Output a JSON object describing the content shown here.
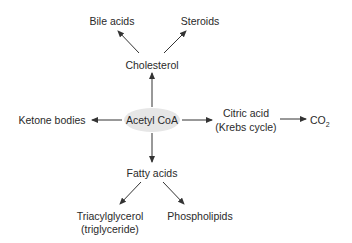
{
  "diagram": {
    "center": {
      "label": "Acetyl CoA",
      "fill": "#e6e6e6"
    },
    "nodes": {
      "cholesterol": "Cholesterol",
      "bile_acids": "Bile acids",
      "steroids": "Steroids",
      "ketone_bodies": "Ketone bodies",
      "citric_acid_line1": "Citric acid",
      "citric_acid_line2": "(Krebs cycle)",
      "co2_main": "CO",
      "co2_sub": "2",
      "fatty_acids": "Fatty acids",
      "triacylglycerol_line1": "Triacylglycerol",
      "triacylglycerol_line2": "(triglyceride)",
      "phospholipids": "Phospholipids"
    },
    "edges": [
      {
        "from": "Acetyl CoA",
        "to": "Cholesterol"
      },
      {
        "from": "Cholesterol",
        "to": "Bile acids"
      },
      {
        "from": "Cholesterol",
        "to": "Steroids"
      },
      {
        "from": "Acetyl CoA",
        "to": "Ketone bodies"
      },
      {
        "from": "Acetyl CoA",
        "to": "Citric acid (Krebs cycle)"
      },
      {
        "from": "Citric acid (Krebs cycle)",
        "to": "CO2"
      },
      {
        "from": "Acetyl CoA",
        "to": "Fatty acids"
      },
      {
        "from": "Fatty acids",
        "to": "Triacylglycerol (triglyceride)"
      },
      {
        "from": "Fatty acids",
        "to": "Phospholipids"
      }
    ],
    "line_color": "#333333"
  }
}
